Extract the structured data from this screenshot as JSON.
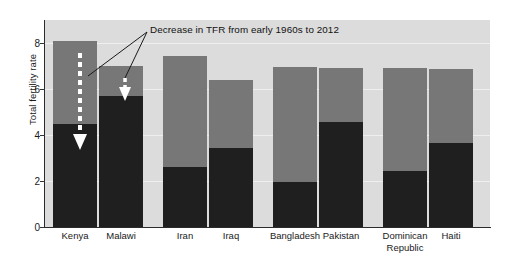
{
  "chart_data": {
    "type": "bar",
    "title": "",
    "subtitle": "",
    "xlabel": "",
    "ylabel": "Total fertility rate",
    "ylim": [
      0,
      9
    ],
    "yticks": [
      0,
      2,
      4,
      6,
      8
    ],
    "ytick_labels": [
      "0",
      "2",
      "4",
      "6",
      "8"
    ],
    "grid": true,
    "legend_position": "none",
    "categories": [
      "Kenya",
      "Malawi",
      "Iran",
      "Iraq",
      "Bangladesh",
      "Pakistan",
      "Dominican\nRepublic",
      "Haiti"
    ],
    "series": [
      {
        "name": "Early 1960s",
        "color": "#777777",
        "values": [
          8.1,
          7.0,
          7.45,
          6.4,
          6.95,
          6.9,
          6.9,
          6.85
        ]
      },
      {
        "name": "2012",
        "color": "#1f1f1f",
        "values": [
          4.5,
          5.7,
          2.6,
          3.45,
          1.95,
          4.55,
          2.45,
          3.65
        ]
      }
    ],
    "annotations": [
      {
        "text": "Decrease in TFR from early 1960s to 2012",
        "targets": [
          "Kenya",
          "Malawi"
        ]
      }
    ]
  },
  "annotation": {
    "label": "Decrease in TFR from early 1960s to 2012"
  },
  "axes": {
    "y_title": "Total fertility rate"
  },
  "colors": {
    "plot_background": "#dcdcdc",
    "gridline": "#efefef",
    "axis": "#2b2b2b",
    "bar_early": "#777777",
    "bar_recent": "#1f1f1f",
    "arrow": "#ffffff",
    "text": "#1a1a1a"
  }
}
